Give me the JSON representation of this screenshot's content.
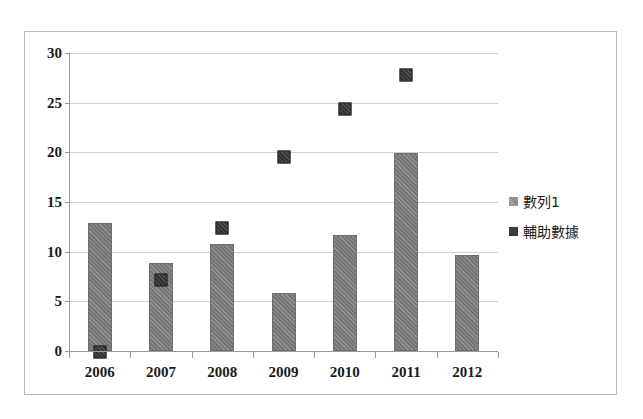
{
  "chart_data": {
    "type": "bar",
    "title": "",
    "xlabel": "",
    "ylabel": "",
    "categories": [
      "2006",
      "2007",
      "2008",
      "2009",
      "2010",
      "2011",
      "2012"
    ],
    "ylim": [
      0,
      30
    ],
    "yticks": [
      0,
      5,
      10,
      15,
      20,
      25,
      30
    ],
    "ytick_labels": [
      "0",
      "5",
      "10",
      "15",
      "20",
      "25",
      "30"
    ],
    "grid": true,
    "legend_position": "right",
    "series": [
      {
        "name": "數列1",
        "chart_type": "bar",
        "color": "#7b7b7b",
        "values": [
          12.9,
          8.9,
          10.8,
          5.8,
          11.7,
          19.9,
          9.7
        ]
      },
      {
        "name": "輔助數據",
        "chart_type": "scatter",
        "color": "#383838",
        "values": [
          -0.1,
          7.1,
          12.4,
          19.5,
          24.4,
          27.8,
          null
        ]
      }
    ]
  },
  "legend": {
    "entries": [
      {
        "label": "數列1",
        "swatch": "series1-swatch"
      },
      {
        "label": "輔助數據",
        "swatch": "aux-data-swatch"
      }
    ]
  }
}
